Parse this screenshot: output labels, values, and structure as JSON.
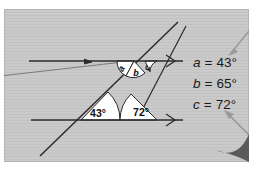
{
  "figure": {
    "name": "parallel-lines-transversal-angle-diagram",
    "panel": {
      "background_color": "#c9c9c9",
      "texture": "horizontal-hairlines",
      "border_color": "#b0b0b0"
    },
    "page_curl": {
      "name": "page-curl-corner",
      "color": "#5a5a5a"
    }
  },
  "diagram": {
    "stroke_color": "#2b2b2b",
    "wedge_fill": "#ffffff",
    "lines": [
      {
        "name": "upper-parallel-line",
        "arrow": ">"
      },
      {
        "name": "lower-parallel-line",
        "arrow": ">"
      },
      {
        "name": "transversal-line-left",
        "arrow": ""
      },
      {
        "name": "transversal-line-right",
        "arrow": ""
      }
    ],
    "angle_labels": [
      {
        "name": "angle-label-43",
        "text": "43°"
      },
      {
        "name": "angle-label-72",
        "text": "72°"
      }
    ],
    "letter_labels": [
      {
        "name": "angle-letter-a",
        "text": "a"
      },
      {
        "name": "angle-letter-b",
        "text": "b"
      },
      {
        "name": "angle-letter-c",
        "text": "c"
      }
    ]
  },
  "legend": {
    "name": "angle-values-legend",
    "entries": [
      {
        "name": "legend-entry-a",
        "variable": "a",
        "equals": "=",
        "value": "43°"
      },
      {
        "name": "legend-entry-b",
        "variable": "b",
        "equals": "=",
        "value": "65°"
      },
      {
        "name": "legend-entry-c",
        "variable": "c",
        "equals": "=",
        "value": "72°"
      }
    ]
  },
  "pointers": [
    {
      "name": "pointer-arrow-to-a",
      "color": "#9a9a9a",
      "direction": "down-left"
    },
    {
      "name": "pointer-arrow-to-c",
      "color": "#9a9a9a",
      "direction": "up-left"
    }
  ]
}
